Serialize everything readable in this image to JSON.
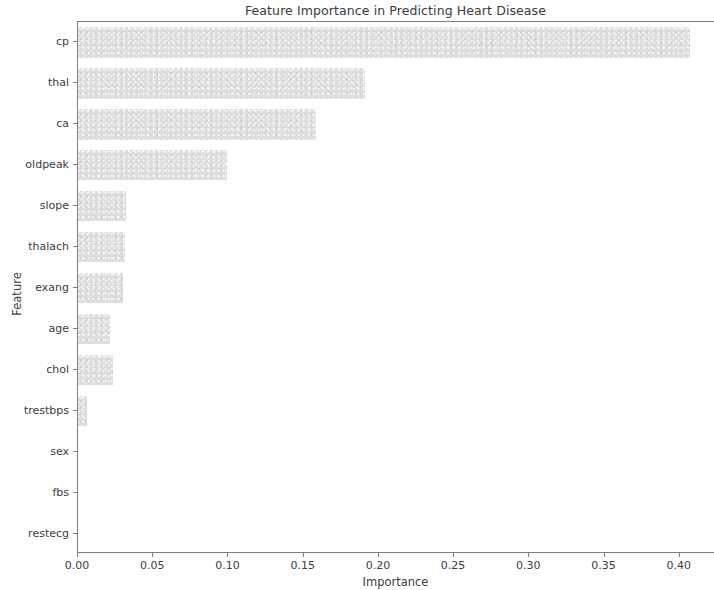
{
  "chart_data": {
    "type": "bar",
    "orientation": "horizontal",
    "title": "Feature Importance in Predicting Heart Disease",
    "xlabel": "Importance",
    "ylabel": "Feature",
    "categories": [
      "cp",
      "thal",
      "ca",
      "oldpeak",
      "slope",
      "thalach",
      "exang",
      "age",
      "chol",
      "trestbps",
      "sex",
      "fbs",
      "restecg"
    ],
    "values": [
      0.407,
      0.191,
      0.158,
      0.099,
      0.032,
      0.031,
      0.03,
      0.021,
      0.023,
      0.006,
      0.0,
      0.0,
      0.0
    ],
    "xlim": [
      0.0,
      0.4234
    ],
    "xticks": [
      0.0,
      0.05,
      0.1,
      0.15,
      0.2,
      0.25,
      0.3,
      0.35,
      0.4
    ],
    "xtick_labels": [
      "0.00",
      "0.05",
      "0.10",
      "0.15",
      "0.20",
      "0.25",
      "0.30",
      "0.35",
      "0.40"
    ],
    "grid": false,
    "legend": null,
    "bar_color": "#dedede",
    "axis_color": "#7e7e7e",
    "text_color": "#3c3c3c"
  }
}
